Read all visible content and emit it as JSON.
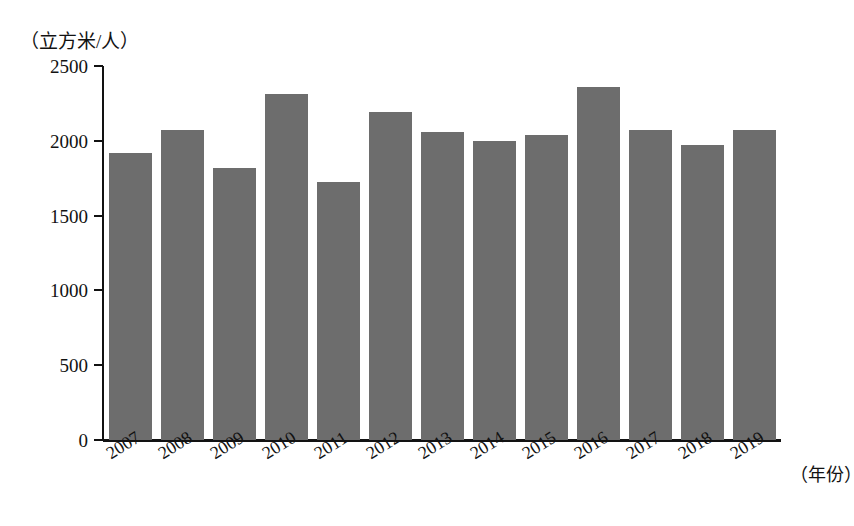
{
  "chart_data": {
    "type": "bar",
    "title": "",
    "subtitle": "",
    "xlabel": "（年份）",
    "ylabel": "（立方米/人）",
    "categories": [
      "2007",
      "2008",
      "2009",
      "2010",
      "2011",
      "2012",
      "2013",
      "2014",
      "2015",
      "2016",
      "2017",
      "2018",
      "2019"
    ],
    "values": [
      1920,
      2070,
      1820,
      2310,
      1725,
      2190,
      2060,
      2000,
      2040,
      2360,
      2075,
      1975,
      2075
    ],
    "series": [
      {
        "name": "人均水资源量",
        "values": [
          1920,
          2070,
          1820,
          2310,
          1725,
          2190,
          2060,
          2000,
          2040,
          2360,
          2075,
          1975,
          2075
        ]
      }
    ],
    "ylim": [
      0,
      2500
    ],
    "ytick_labels": [
      "0",
      "500",
      "1000",
      "1500",
      "2000",
      "2500"
    ],
    "ytick_values": [
      0,
      500,
      1000,
      1500,
      2000,
      2500
    ],
    "grid": false,
    "legend": "none",
    "bar_color": "#6d6d6d",
    "axis_color": "#121212",
    "background_color": "#ffffff"
  },
  "axes": {
    "y_unit_caption": "（立方米/人）",
    "x_unit_caption": "（年份）"
  }
}
